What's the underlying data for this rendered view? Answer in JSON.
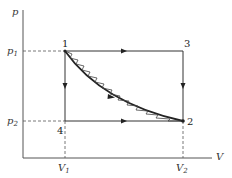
{
  "diagram": {
    "type": "p-V thermodynamic process diagram",
    "axes": {
      "y_label": "p",
      "x_label": "V",
      "y_ticks": [
        {
          "label": "p",
          "sub": "1"
        },
        {
          "label": "p",
          "sub": "2"
        }
      ],
      "x_ticks": [
        {
          "label": "V",
          "sub": "1"
        },
        {
          "label": "V",
          "sub": "2"
        }
      ]
    },
    "points": [
      {
        "id": "1",
        "label": "1",
        "p": "p1",
        "V": "V1"
      },
      {
        "id": "2",
        "label": "2",
        "p": "p2",
        "V": "V2"
      },
      {
        "id": "3",
        "label": "3",
        "p": "p1",
        "V": "V2"
      },
      {
        "id": "4",
        "label": "4",
        "p": "p2",
        "V": "V1"
      }
    ],
    "paths": [
      {
        "name": "1-3",
        "style": "straight",
        "arrow": "toward 3"
      },
      {
        "name": "3-2",
        "style": "straight",
        "arrow": "toward 2"
      },
      {
        "name": "1-4",
        "style": "straight",
        "arrow": "toward 4"
      },
      {
        "name": "4-2",
        "style": "straight",
        "arrow": "toward 2"
      },
      {
        "name": "1-2 curve",
        "style": "smooth bold curve",
        "arrow": "toward 2"
      },
      {
        "name": "1-2 irreversible",
        "style": "zigzag",
        "arrow": "none"
      }
    ]
  }
}
